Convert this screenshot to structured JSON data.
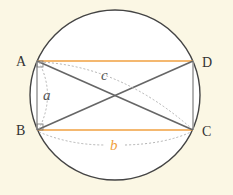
{
  "diagram": {
    "points": {
      "A": {
        "label": "A",
        "x": 37,
        "y": 61
      },
      "B": {
        "label": "B",
        "x": 37,
        "y": 130
      },
      "C": {
        "label": "C",
        "x": 193,
        "y": 130
      },
      "D": {
        "label": "D",
        "x": 193,
        "y": 61
      }
    },
    "circle": {
      "cx": 115,
      "cy": 95,
      "r": 85
    },
    "variables": {
      "a": "a",
      "b": "b",
      "c": "c"
    },
    "colors": {
      "background": "#fbf7e4",
      "circle_fill": "#ffffff",
      "circle_stroke": "#444444",
      "horizontal_sides": "#f0a040",
      "vertical_sides": "#888888",
      "diagonals": "#666666",
      "dashed_arcs": "#aaaaaa",
      "label_b": "#f0a040",
      "label_ac": "#555555"
    }
  }
}
